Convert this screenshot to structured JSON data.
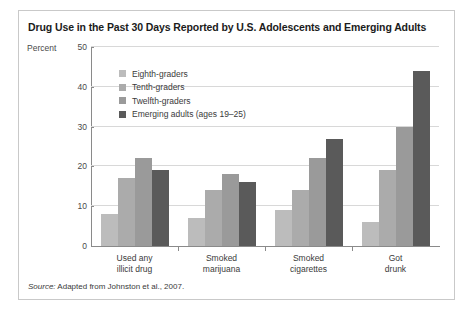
{
  "figure": {
    "title": "Drug Use in the Past 30 Days Reported by U.S. Adolescents and Emerging Adults",
    "source_word": "Source:",
    "source_text": " Adapted from Johnston et al., 2007."
  },
  "chart_data": {
    "type": "bar",
    "title": "Drug Use in the Past 30 Days Reported by U.S. Adolescents and Emerging Adults",
    "xlabel": "",
    "ylabel": "Percent",
    "ylim": [
      0,
      50
    ],
    "yticks": [
      0,
      10,
      20,
      30,
      40,
      50
    ],
    "grid": true,
    "legend_position": "inside-top-left",
    "categories": [
      [
        "Used any",
        "illicit drug"
      ],
      [
        "Smoked",
        "marijuana"
      ],
      [
        "Smoked",
        "cigarettes"
      ],
      [
        "Got",
        "drunk"
      ]
    ],
    "series": [
      {
        "name": "Eighth-graders",
        "color": "#bcbcbc",
        "values": [
          8,
          7,
          9,
          6
        ]
      },
      {
        "name": "Tenth-graders",
        "color": "#ababab",
        "values": [
          17,
          14,
          14,
          19
        ]
      },
      {
        "name": "Twelfth-graders",
        "color": "#9a9a9a",
        "values": [
          22,
          18,
          22,
          30
        ]
      },
      {
        "name": "Emerging adults (ages 19–25)",
        "color": "#5a5a5a",
        "values": [
          19,
          16,
          27,
          44
        ]
      }
    ]
  }
}
